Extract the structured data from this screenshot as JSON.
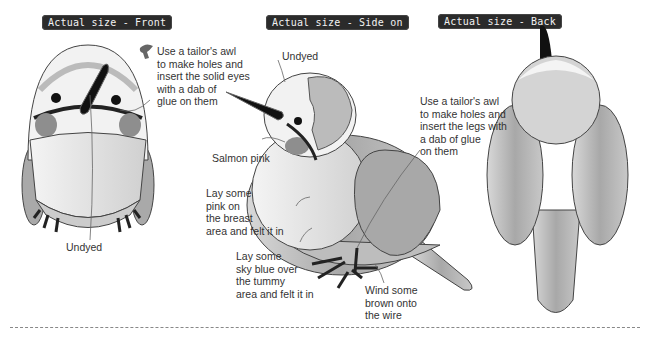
{
  "headings": {
    "front": "Actual size - Front",
    "side": "Actual size - Side on",
    "back": "Actual size - Back"
  },
  "annotations": {
    "eyes": "Use a tailor's awl\nto make holes and\ninsert the solid eyes\nwith a dab of\nglue on them",
    "front_undyed": "Undyed",
    "side_undyed": "Undyed",
    "salmon": "Salmon pink",
    "legs": "Use a tailor's awl\nto make holes and\ninsert the legs with\na dab of glue\non them",
    "breast": "Lay some\npink on\nthe breast\narea and felt it in",
    "tummy": "Lay some\nsky blue over\nthe tummy\narea and felt it in",
    "wire": "Wind some\nbrown onto\nthe wire"
  },
  "icons": {
    "awl": "tailors-awl-icon"
  },
  "colors": {
    "tag_bg": "#2b2b2b",
    "body_gray": "#b8b8b8",
    "light_gray": "#e2e2e2",
    "beak": "#111111"
  }
}
